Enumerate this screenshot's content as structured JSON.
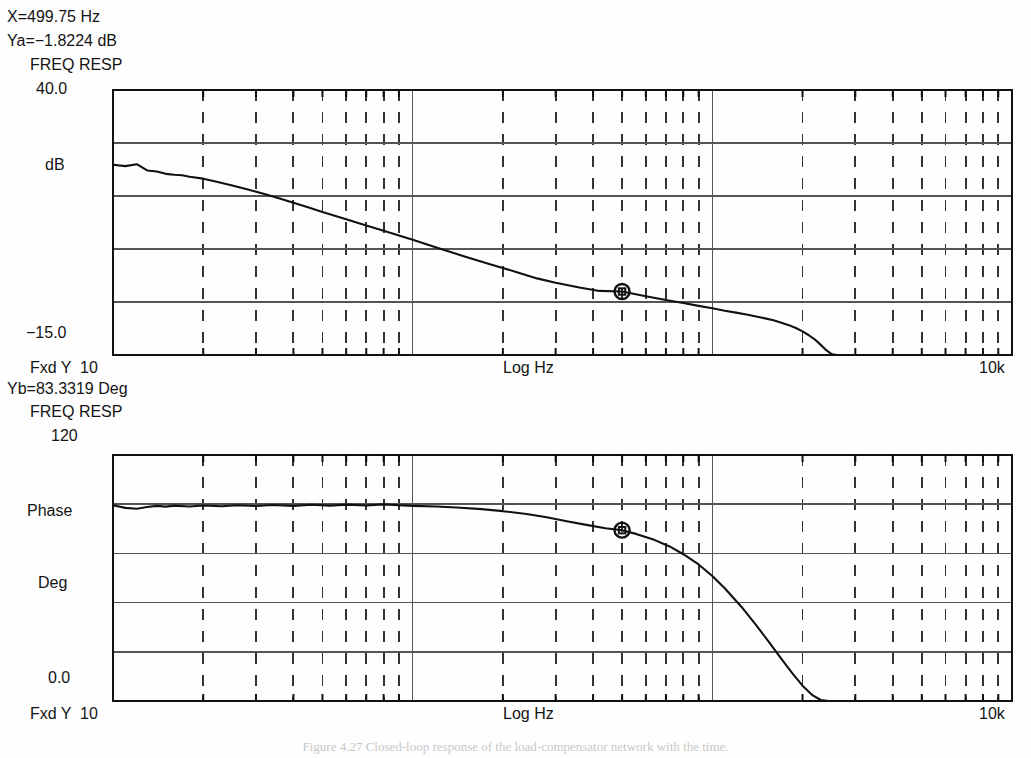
{
  "readouts": {
    "x_marker": "X=499.75 Hz",
    "ya_marker": "Ya=−1.8224 dB",
    "yb_marker": "Yb=83.3319 Deg"
  },
  "caption": "Figure 4.27   Closed-loop response of the load-compensator network with the time.",
  "magnitude_panel": {
    "title": "FREQ RESP",
    "y_top_label": "40.0",
    "y_unit_label": "dB",
    "y_bottom_label": "−15.0",
    "x_left_label": "Fxd Y  10",
    "x_axis_label": "Log Hz",
    "x_right_label": "10k"
  },
  "phase_panel": {
    "title": "FREQ RESP",
    "y_top_label": "120",
    "y_name_label": "Phase",
    "y_unit_label": "Deg",
    "y_bottom_label": "0.0",
    "x_left_label": "Fxd Y  10",
    "x_axis_label": "Log Hz",
    "x_right_label": "10k"
  },
  "colors": {
    "trace": "#111111",
    "grid_solid": "#555555",
    "grid_dash": "#333333",
    "frame": "#111111",
    "background": "#fefefe"
  },
  "chart_data": [
    {
      "type": "line",
      "title": "FREQ RESP",
      "id": "magnitude",
      "xlabel": "Log Hz",
      "ylabel": "dB",
      "xscale": "log",
      "xlim": [
        10,
        10000
      ],
      "ylim": [
        -15.0,
        40.0
      ],
      "xticks": [
        10,
        100,
        1000,
        10000
      ],
      "xticklabels": [
        "10",
        "",
        "",
        "10k"
      ],
      "yticks": [
        -15.0,
        -4.0,
        7.0,
        18.0,
        29.0,
        40.0
      ],
      "yticklabels": [
        "−15.0",
        "",
        "",
        "",
        "",
        "40.0"
      ],
      "grid": true,
      "marker": {
        "x": 499.75,
        "y": -1.8224,
        "label": "X=499.75 Hz  Ya=−1.8224 dB"
      },
      "series": [
        {
          "name": "Magnitude",
          "x": [
            10,
            11,
            12,
            13,
            14,
            15,
            16,
            17,
            18,
            20,
            22,
            25,
            28,
            32,
            36,
            40,
            45,
            50,
            60,
            70,
            80,
            90,
            100,
            120,
            150,
            180,
            220,
            260,
            300,
            360,
            420,
            500,
            600,
            700,
            800,
            900,
            1000,
            1100,
            1200,
            1300,
            1400,
            1500,
            1600,
            1700,
            1800,
            1900,
            2000,
            2100,
            2200,
            2300,
            2400,
            2500,
            2600
          ],
          "y": [
            24.5,
            24.2,
            24.6,
            23.3,
            23.1,
            22.6,
            22.4,
            22.3,
            22.0,
            21.6,
            21.0,
            20.2,
            19.4,
            18.4,
            17.5,
            16.6,
            15.6,
            14.7,
            13.2,
            11.9,
            10.8,
            9.8,
            8.9,
            7.3,
            5.4,
            3.9,
            2.3,
            0.9,
            0.0,
            -1.0,
            -1.7,
            -1.82,
            -2.8,
            -3.6,
            -4.2,
            -4.8,
            -5.3,
            -5.8,
            -6.2,
            -6.6,
            -7.0,
            -7.4,
            -7.8,
            -8.3,
            -8.8,
            -9.4,
            -10.1,
            -10.9,
            -11.8,
            -12.9,
            -14.0,
            -14.8,
            -15.0
          ]
        }
      ]
    },
    {
      "type": "line",
      "title": "FREQ RESP",
      "id": "phase",
      "xlabel": "Log Hz",
      "ylabel": "Deg",
      "xscale": "log",
      "xlim": [
        10,
        10000
      ],
      "ylim": [
        0.0,
        120.0
      ],
      "xticks": [
        10,
        100,
        1000,
        10000
      ],
      "xticklabels": [
        "10",
        "",
        "",
        "10k"
      ],
      "yticks": [
        0.0,
        24.0,
        48.0,
        72.0,
        96.0,
        120.0
      ],
      "yticklabels": [
        "0.0",
        "",
        "",
        "",
        "",
        "120"
      ],
      "grid": true,
      "marker": {
        "x": 499.75,
        "y": 83.3319,
        "label": "X=499.75 Hz  Yb=83.3319 Deg"
      },
      "series": [
        {
          "name": "Phase",
          "x": [
            10,
            11,
            12,
            13,
            14,
            15,
            16,
            18,
            20,
            23,
            26,
            30,
            34,
            40,
            46,
            53,
            60,
            70,
            80,
            90,
            100,
            120,
            140,
            170,
            200,
            240,
            280,
            330,
            380,
            440,
            500,
            560,
            640,
            720,
            800,
            900,
            1000,
            1100,
            1250,
            1400,
            1550,
            1700,
            1850,
            2000,
            2150,
            2300,
            2450,
            2600
          ],
          "y": [
            95.5,
            94.2,
            93.8,
            94.6,
            95.2,
            94.8,
            95.3,
            94.9,
            95.4,
            95.0,
            95.5,
            95.1,
            95.6,
            95.2,
            95.7,
            95.3,
            95.8,
            95.4,
            95.9,
            95.5,
            95.2,
            94.9,
            94.4,
            93.6,
            92.6,
            91.2,
            89.6,
            87.6,
            85.9,
            84.3,
            83.33,
            81.4,
            78.6,
            75.4,
            71.6,
            66.6,
            61.0,
            55.0,
            46.0,
            37.0,
            28.5,
            20.5,
            13.5,
            7.5,
            3.0,
            0.5,
            0.0,
            0.0
          ]
        }
      ]
    }
  ]
}
